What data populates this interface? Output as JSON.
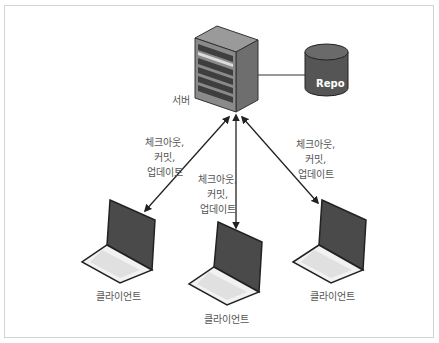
{
  "diagram": {
    "type": "centralized-version-control",
    "nodes": {
      "server": {
        "label": "서버",
        "icon": "server-rack-icon"
      },
      "repo": {
        "label": "Repo",
        "icon": "database-cylinder-icon"
      },
      "clients": [
        {
          "label": "클라이언트",
          "icon": "laptop-icon"
        },
        {
          "label": "클라이언트",
          "icon": "laptop-icon"
        },
        {
          "label": "클라이언트",
          "icon": "laptop-icon"
        }
      ]
    },
    "edges": [
      {
        "from": "server",
        "to": "repo",
        "style": "line"
      },
      {
        "from": "server",
        "to": "client-left",
        "style": "double-arrow",
        "label_lines": [
          "체크아웃,",
          "커밋,",
          "업데이트"
        ]
      },
      {
        "from": "server",
        "to": "client-middle",
        "style": "double-arrow",
        "label_lines": [
          "체크아웃,",
          "커밋,",
          "업데이트"
        ]
      },
      {
        "from": "server",
        "to": "client-right",
        "style": "double-arrow",
        "label_lines": [
          "체크아웃,",
          "커밋,",
          "업데이트"
        ]
      }
    ],
    "colors": {
      "frame_border": "#d4d4d4",
      "line": "#222222",
      "label_text": "#555555",
      "server_front": "#8a8a8a",
      "server_side": "#6e6e6e",
      "repo_body": "#555555",
      "repo_top": "#6a6a6a",
      "laptop_screen": "#4a4a4a",
      "laptop_base": "#f0f0f0"
    }
  }
}
